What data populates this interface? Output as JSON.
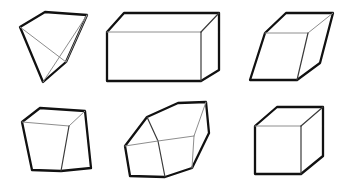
{
  "figure": {
    "background_color": "#ffffff",
    "outline_color": "#111111",
    "inner_edge_color": "#8e8e8e",
    "face_fill_color": "#ffffff",
    "canvas_width": 350,
    "canvas_height": 188,
    "rows": 2,
    "columns": 3,
    "shape_count": 6
  },
  "shapes": [
    {
      "id": "shape-1",
      "name": "triangular-wedge",
      "label": "Triangular wedge",
      "row": 1,
      "column": 1,
      "outline_points": "20,27 45,12 87,15 66,62 43,82",
      "inner_edges": [
        "20,27 66,62",
        "66,62 87,15",
        "43,82 87,15"
      ]
    },
    {
      "id": "shape-2",
      "name": "rectangular-box",
      "label": "Rectangular box",
      "row": 1,
      "column": 2,
      "outline_points": "107,32 124,13 219,13 219,70 201,81 107,81",
      "inner_edges": [
        "107,32 201,32",
        "201,32 219,13",
        "201,32 201,81"
      ]
    },
    {
      "id": "shape-3",
      "name": "oblique-parallelepiped",
      "label": "Oblique parallelepiped",
      "row": 1,
      "column": 3,
      "outline_points": "265,33 286,13 333,13 320,63 297,80 250,80",
      "inner_edges": [
        "265,33 308,33",
        "308,33 333,13",
        "308,33 297,80"
      ]
    },
    {
      "id": "shape-4",
      "name": "tapered-block",
      "label": "Tapered block",
      "row": 2,
      "column": 1,
      "outline_points": "22,122 40,108 85,111 91,168 61,171 32,170"
    },
    {
      "id": "shape-5",
      "name": "hexagonal-prism",
      "label": "Hexagonal prism",
      "row": 2,
      "column": 2,
      "outline_points": "125,146 147,117 178,103 206,102 209,133 192,168 165,177 130,176"
    },
    {
      "id": "shape-6",
      "name": "cube",
      "label": "Cube",
      "row": 2,
      "column": 3,
      "outline_points": "255,126 277,107 323,107 323,156 301,174 255,174"
    }
  ]
}
